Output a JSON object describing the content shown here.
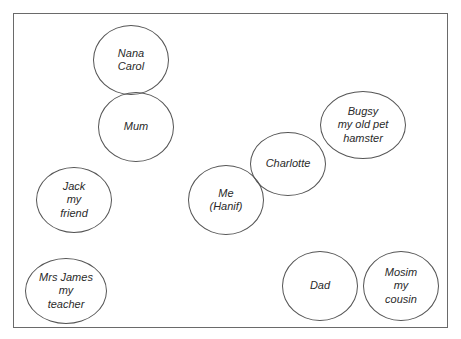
{
  "diagram": {
    "type": "relationship-map",
    "nodes": [
      {
        "id": "nana",
        "label": "Nana\nCarol",
        "cx": 131,
        "cy": 60,
        "rx": 38,
        "ry": 35
      },
      {
        "id": "mum",
        "label": "Mum",
        "cx": 136,
        "cy": 127,
        "rx": 38,
        "ry": 35
      },
      {
        "id": "jack",
        "label": "Jack\nmy\nfriend",
        "cx": 74,
        "cy": 200,
        "rx": 38,
        "ry": 33
      },
      {
        "id": "mrsjames",
        "label": "Mrs James\nmy\nteacher",
        "cx": 66,
        "cy": 291,
        "rx": 41,
        "ry": 33
      },
      {
        "id": "me",
        "label": "Me\n(Hanif)",
        "cx": 226,
        "cy": 200,
        "rx": 38,
        "ry": 35
      },
      {
        "id": "charlotte",
        "label": "Charlotte",
        "cx": 288,
        "cy": 164,
        "rx": 38,
        "ry": 32
      },
      {
        "id": "bugsy",
        "label": "Bugsy\nmy old pet\nhamster",
        "cx": 363,
        "cy": 125,
        "rx": 43,
        "ry": 34
      },
      {
        "id": "dad",
        "label": "Dad",
        "cx": 320,
        "cy": 286,
        "rx": 38,
        "ry": 35
      },
      {
        "id": "mosim",
        "label": "Mosim\nmy\ncousin",
        "cx": 401,
        "cy": 286,
        "rx": 38,
        "ry": 35
      }
    ]
  }
}
